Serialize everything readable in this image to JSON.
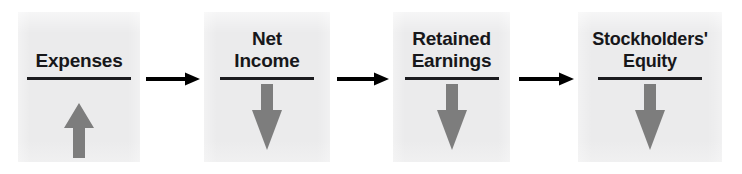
{
  "diagram": {
    "type": "linear-flow",
    "background_color": "#ffffff",
    "box_fill_color": "#ebebec",
    "text_color": "#17171a",
    "rule_color": "#1b1b1e",
    "trend_arrow_color": "#7d7d7d",
    "connector_color": "#000000",
    "boxes": [
      {
        "id": "expenses",
        "label": "Expenses",
        "label_lines": [
          "Expenses"
        ],
        "trend": "up",
        "trend_icon": "arrow-up-icon",
        "x": 18,
        "y": 12,
        "width": 122,
        "height": 150,
        "rule_width": 104
      },
      {
        "id": "net-income",
        "label": "Net Income",
        "label_lines": [
          "Net",
          "Income"
        ],
        "trend": "down",
        "trend_icon": "arrow-down-icon",
        "x": 204,
        "y": 12,
        "width": 126,
        "height": 150,
        "rule_width": 94
      },
      {
        "id": "retained-earnings",
        "label": "Retained Earnings",
        "label_lines": [
          "Retained",
          "Earnings"
        ],
        "trend": "down",
        "trend_icon": "arrow-down-icon",
        "x": 393,
        "y": 12,
        "width": 117,
        "height": 150,
        "rule_width": 94
      },
      {
        "id": "stockholders-equity",
        "label": "Stockholders' Equity",
        "label_lines": [
          "Stockholders'",
          "Equity"
        ],
        "trend": "down",
        "trend_icon": "arrow-down-icon",
        "x": 578,
        "y": 12,
        "width": 144,
        "height": 150,
        "rule_width": 104
      }
    ],
    "connectors": [
      {
        "id": "expenses-to-net-income",
        "icon": "arrow-right-icon",
        "from": "expenses",
        "to": "net-income",
        "x": 146,
        "y": 70,
        "width": 54,
        "height": 18
      },
      {
        "id": "net-income-to-retained-earnings",
        "icon": "arrow-right-icon",
        "from": "net-income",
        "to": "retained-earnings",
        "x": 337,
        "y": 70,
        "width": 52,
        "height": 18
      },
      {
        "id": "retained-earnings-to-stockholders-equity",
        "icon": "arrow-right-icon",
        "from": "retained-earnings",
        "to": "stockholders-equity",
        "x": 519,
        "y": 70,
        "width": 55,
        "height": 18
      }
    ]
  }
}
